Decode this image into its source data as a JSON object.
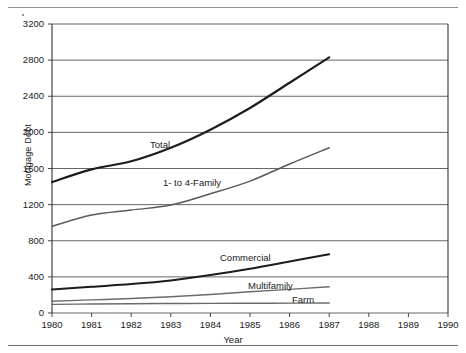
{
  "chart_data": {
    "type": "line",
    "title": "",
    "xlabel": "Year",
    "ylabel": "Mortgage Debt",
    "xlim": [
      1980,
      1990
    ],
    "ylim": [
      0,
      3200
    ],
    "ytick_labels": [
      "0",
      "400",
      "800",
      "1200",
      "1600",
      "2000",
      "2400",
      "2800",
      "3200"
    ],
    "ytick_values": [
      0,
      400,
      800,
      1200,
      1600,
      2000,
      2400,
      2800,
      3200
    ],
    "xtick_labels": [
      "1980",
      "1981",
      "1982",
      "1983",
      "1984",
      "1985",
      "1986",
      "1987",
      "1988",
      "1989",
      "1990"
    ],
    "xtick_values": [
      1980,
      1981,
      1982,
      1983,
      1984,
      1985,
      1986,
      1987,
      1988,
      1989,
      1990
    ],
    "grid": "horizontal",
    "legend": "inline-labels",
    "x": [
      1980,
      1981,
      1982,
      1983,
      1984,
      1985,
      1986,
      1987
    ],
    "series": [
      {
        "name": "Total",
        "values": [
          1450,
          1590,
          1680,
          1830,
          2030,
          2270,
          2550,
          2830
        ],
        "color": "#1c1c1c",
        "width": 2.2,
        "label_x": 150,
        "label_y": 140
      },
      {
        "name": "1- to 4-Family",
        "values": [
          960,
          1085,
          1140,
          1195,
          1320,
          1460,
          1650,
          1830
        ],
        "color": "#5a5a5a",
        "width": 1.5,
        "label_x": 163,
        "label_y": 178
      },
      {
        "name": "Commercial",
        "values": [
          260,
          290,
          320,
          360,
          420,
          490,
          570,
          650
        ],
        "color": "#1c1c1c",
        "width": 2.0,
        "label_x": 220,
        "label_y": 253
      },
      {
        "name": "Multifamily",
        "values": [
          130,
          145,
          160,
          180,
          205,
          235,
          262,
          290
        ],
        "color": "#6a6a6a",
        "width": 1.4,
        "label_x": 248,
        "label_y": 281
      },
      {
        "name": "Farm",
        "values": [
          95,
          100,
          103,
          105,
          107,
          108,
          109,
          110
        ],
        "color": "#6a6a6a",
        "width": 1.4,
        "label_x": 292,
        "label_y": 295
      }
    ]
  }
}
